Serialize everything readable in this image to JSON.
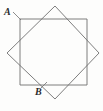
{
  "figure": {
    "kind": "geometry-diagram",
    "canvas": {
      "width": 103,
      "height": 111
    },
    "background_color": "#fdfdfc",
    "stroke_color": "#6f6f6f",
    "stroke_width": 0.9,
    "label_color": "#2b2b2b",
    "shapes": [
      {
        "name": "axis-aligned-square",
        "type": "square",
        "points": "20,19 87,19 87,85 20,85"
      },
      {
        "name": "rotated-square",
        "type": "square",
        "points": "55,6 99,53 55,99 7,53"
      }
    ],
    "leaders": [
      {
        "name": "leader-line-a",
        "from": [
          13,
          12
        ],
        "to": [
          21,
          20
        ]
      },
      {
        "name": "leader-line-b",
        "from": [
          41,
          88
        ],
        "to": [
          47,
          82
        ]
      }
    ],
    "labels": {
      "a": "A",
      "b": "B"
    }
  }
}
